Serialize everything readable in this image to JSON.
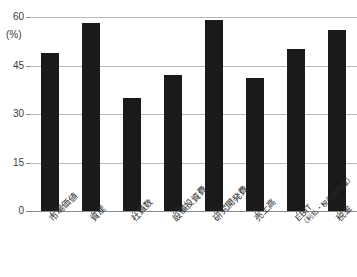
{
  "chart_data": {
    "type": "bar",
    "title": "",
    "xlabel": "",
    "ylabel": "(%)",
    "unit": "(%)",
    "ylim": [
      0,
      60
    ],
    "yticks": [
      0,
      15,
      30,
      45,
      60
    ],
    "ytick_labels": [
      "0",
      "15",
      "30",
      "45",
      "60"
    ],
    "grid": true,
    "legend": "none",
    "bar_color": "#1a1a1a",
    "categories": [
      "市場価値",
      "資産",
      "社員数",
      "設備投資費",
      "研究開発費",
      "売上高",
      "EBIT",
      "税金"
    ],
    "category_sublabels": [
      "",
      "",
      "",
      "",
      "",
      "",
      "（利払・税引前利益）",
      ""
    ],
    "values": [
      49,
      58,
      35,
      42,
      59,
      41,
      50,
      56
    ]
  },
  "axis": {
    "unit_label": "(%)"
  }
}
